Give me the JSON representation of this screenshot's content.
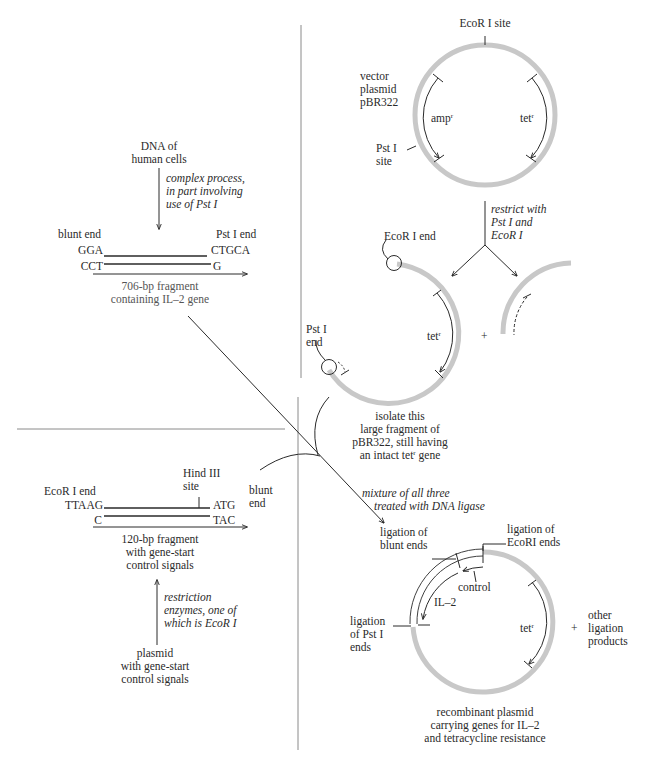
{
  "colors": {
    "plasmid_ring": "#c8c8c8",
    "ink": "#2a2a2a",
    "divider": "#8a8a8a"
  },
  "human_dna": {
    "source_label": [
      "DNA of",
      "human cells"
    ],
    "process_label": [
      "complex process,",
      "in part involving",
      "use of Pst I"
    ],
    "left_end_label": "blunt end",
    "right_end_label": "Pst I end",
    "top_left_seq": "GGA",
    "top_right_seq": "CTGCA",
    "bottom_left_seq": "CCT",
    "bottom_right_seq": "G",
    "fragment_label": [
      "706-bp fragment",
      "containing IL–2 gene"
    ]
  },
  "vector": {
    "name_label": [
      "vector",
      "plasmid",
      "pBR322"
    ],
    "ecori_site_label": "EcoR I site",
    "psti_site_label": [
      "Pst I",
      "site"
    ],
    "amp_gene": "amp",
    "tet_gene": "tet",
    "resistance_sup": "r",
    "restrict_label": [
      "restrict with",
      "Pst I and",
      "EcoR I"
    ]
  },
  "large_fragment": {
    "ecori_end_label": "EcoR I end",
    "psti_end_label": [
      "Pst I",
      "end"
    ],
    "tet_gene": "tet",
    "plus": "+",
    "isolate_label": [
      "isolate this",
      "large fragment of",
      "pBR322, still having",
      "an intact tet",
      " gene"
    ]
  },
  "control_fragment": {
    "left_end_label": "EcoR I end",
    "hind_label": [
      "Hind III",
      "site"
    ],
    "right_end_label": [
      "blunt",
      "end"
    ],
    "top_left_seq": "TTAAG",
    "top_right_seq": "ATG",
    "bottom_left_seq": "C",
    "bottom_right_seq": "TAC",
    "fragment_label": [
      "120-bp fragment",
      "with gene-start",
      "control signals"
    ],
    "process_label": [
      "restriction",
      "enzymes, one of",
      "which is EcoR I"
    ],
    "source_label": [
      "plasmid",
      "with gene-start",
      "control signals"
    ]
  },
  "ligation": {
    "mixture_label": [
      "mixture of all three",
      "treated with DNA ligase"
    ],
    "blunt_label": [
      "ligation of",
      "blunt ends"
    ],
    "ecori_label": [
      "ligation of",
      "EcoRI ends"
    ],
    "control_label": "control",
    "il2_label": "IL–2",
    "psti_label": [
      "ligation",
      "of Pst I",
      "ends"
    ],
    "tet_gene": "tet",
    "plus": "+",
    "other_label": [
      "other",
      "ligation",
      "products"
    ],
    "result_label": [
      "recombinant plasmid",
      "carrying genes for IL–2",
      "and tetracycline resistance"
    ]
  }
}
